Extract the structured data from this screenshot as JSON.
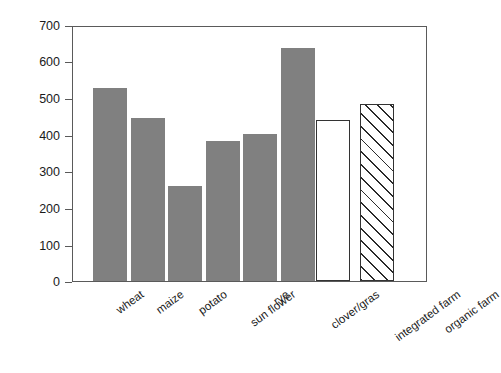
{
  "chart_data": {
    "type": "bar",
    "title": "",
    "xlabel": "",
    "ylabel": "C-Input from roots [kg C ha⁻¹]",
    "ylim": [
      0,
      700
    ],
    "yticks": [
      0,
      100,
      200,
      300,
      400,
      500,
      600,
      700
    ],
    "ytick_labels": [
      "0",
      "100",
      "200",
      "300",
      "400",
      "500",
      "600",
      "700"
    ],
    "grid": false,
    "legend": "none",
    "categories": [
      "wheat",
      "maize",
      "potato",
      "sun flower",
      "rye",
      "clover/gras",
      "integrated farm",
      "organic farm"
    ],
    "values": [
      533,
      450,
      262,
      387,
      405,
      643,
      445,
      487
    ],
    "bar_styles": [
      "solid-gray",
      "solid-gray",
      "solid-gray",
      "solid-gray",
      "solid-gray",
      "solid-gray",
      "open-white",
      "hatched-diagonal"
    ],
    "colors": {
      "bar_gray": "#808080",
      "bar_open": "#ffffff",
      "bar_outline": "#333333",
      "axis": "#5a5a5a",
      "text": "#1a1a1a",
      "background": "#ffffff"
    }
  },
  "axis": {
    "y_title": "C-Input from roots [kg C ha⁻¹]"
  }
}
